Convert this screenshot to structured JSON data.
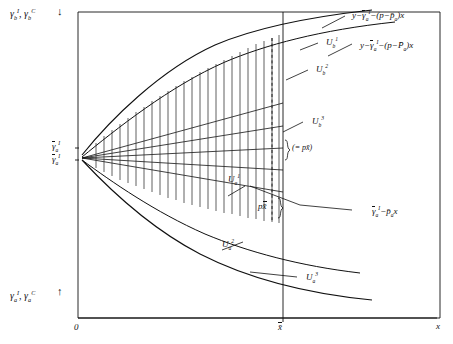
{
  "figure": {
    "type": "economic-diagram",
    "axes": {
      "x_axis_label": "x",
      "origin_label": "0",
      "x_tick_label": "x̄",
      "top_left_axis_label_parts": {
        "gamma": "γ",
        "sub": "b",
        "sup1": "I",
        "sup2": "C",
        "sep": ", "
      },
      "bottom_left_axis_label_parts": {
        "gamma": "γ",
        "sub": "a",
        "sup1": "I",
        "sup2": "C",
        "sep": ", "
      },
      "top_left_arrow": "↓",
      "bottom_left_arrow": "↑"
    },
    "y_ticks": [
      {
        "name": "gamma-bar-a-I-upper",
        "text": "γ",
        "sub": "a",
        "sup": "I"
      },
      {
        "name": "gamma-bar-a-I-lower",
        "text": "γ",
        "sub": "a",
        "sup": "I"
      }
    ],
    "curve_labels": [
      {
        "name": "u-b-1",
        "base": "U",
        "sub": "b",
        "sup": "1"
      },
      {
        "name": "u-b-2",
        "base": "U",
        "sub": "b",
        "sup": "2"
      },
      {
        "name": "u-b-3",
        "base": "U",
        "sub": "b",
        "sup": "3"
      },
      {
        "name": "u-a-1",
        "base": "U",
        "sub": "a",
        "sup": "1"
      },
      {
        "name": "u-a-2",
        "base": "U",
        "sub": "a",
        "sup": "2"
      },
      {
        "name": "u-a-3",
        "base": "U",
        "sub": "a",
        "sup": "3"
      }
    ],
    "equations": {
      "top": {
        "name": "equation-upper-envelope",
        "y": "y",
        "minus1": "−",
        "gamma": "γ",
        "gamma_sub": "a",
        "gamma_sup": "I",
        "minus2": "−",
        "open": "(",
        "p": "p",
        "minus3": "−",
        "pbar": "p̄",
        "pbar_sub": "a",
        "close": ")",
        "x": "x"
      },
      "second": {
        "name": "equation-lower-envelope",
        "y": "y",
        "minus1": "−",
        "gamma": "γ",
        "gamma_sub": "a",
        "gamma_sup": "I",
        "minus2": "−",
        "open": "(",
        "p": "p",
        "minus3": "−",
        "pbar": "P̄",
        "pbar_sub": "a",
        "close": ")",
        "x": "x"
      },
      "right": {
        "name": "equation-budget-line",
        "gamma": "γ",
        "gamma_sub": "a",
        "gamma_sup": "I",
        "minus": "−",
        "pbar": "p̄",
        "pbar_sub": "a",
        "x": "x"
      }
    },
    "annotations": [
      {
        "name": "bracket-equals-p-xbar",
        "text": "(= px̄)"
      },
      {
        "name": "p-xbar-label",
        "p": "p",
        "x": "x̄"
      }
    ],
    "colors": {
      "ink": "#101010",
      "background": "#ffffff",
      "hatch": "#2b2b2b"
    }
  }
}
